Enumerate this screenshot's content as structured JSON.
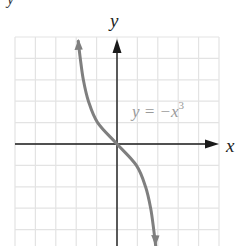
{
  "figure": {
    "top_fragment": "y",
    "x_axis_label": "x",
    "y_axis_label": "y",
    "equation_label": {
      "base": "y = −x",
      "exponent": "3"
    }
  },
  "colors": {
    "background": "#ffffff",
    "grid": "#e3e3e3",
    "axis": "#1a1a1a",
    "curve": "#7f7f7f",
    "equation_text": "#9a9a9a"
  },
  "chart_data": {
    "type": "line",
    "title": "",
    "xlabel": "x",
    "ylabel": "y",
    "annotation": "y = −x^3",
    "grid": true,
    "legend": null,
    "series": [
      {
        "name": "y = −x^3",
        "x": [
          -1.9,
          -1.8,
          -1.65,
          -1.4,
          -0.95,
          0,
          0.95,
          1.4,
          1.65,
          1.8,
          1.9
        ],
        "values": [
          4.8,
          4.0,
          3.0,
          2.0,
          1.0,
          0,
          -1.0,
          -2.0,
          -3.0,
          -4.0,
          -4.8
        ],
        "arrows_at_ends": true
      }
    ],
    "grid_cells": {
      "columns": 10,
      "rows_visible": 10
    },
    "origin_px": [
      117,
      144
    ],
    "cell_px": [
      20.4,
      21.4
    ]
  }
}
